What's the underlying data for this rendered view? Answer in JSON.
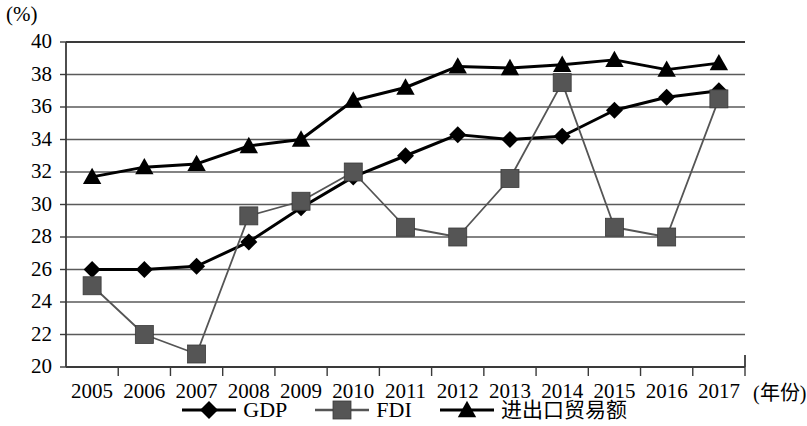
{
  "chart_data": {
    "type": "line",
    "title": "",
    "subtitle": "",
    "xlabel": "(年份)",
    "ylabel": "(%)",
    "unit_label": "(%)",
    "categories": [
      "2005",
      "2006",
      "2007",
      "2008",
      "2009",
      "2010",
      "2011",
      "2012",
      "2013",
      "2014",
      "2015",
      "2016",
      "2017"
    ],
    "x_tick_labels": [
      "2005",
      "2006",
      "2007",
      "2008",
      "2009",
      "2010",
      "2011",
      "2012",
      "2013",
      "2014",
      "2015",
      "2016",
      "2017"
    ],
    "y_tick_labels": [
      "40",
      "38",
      "36",
      "34",
      "32",
      "30",
      "28",
      "26",
      "24",
      "22",
      "20"
    ],
    "y_ticks": [
      20,
      22,
      24,
      26,
      28,
      30,
      32,
      34,
      36,
      38,
      40
    ],
    "ylim": [
      20,
      40
    ],
    "grid": "horizontal",
    "legend_position": "bottom-center",
    "series": [
      {
        "name": "GDP",
        "marker": "diamond",
        "color": "#000000",
        "values": [
          26.0,
          26.0,
          26.2,
          27.7,
          29.8,
          31.7,
          33.0,
          34.3,
          34.0,
          34.2,
          35.8,
          36.6,
          37.0
        ]
      },
      {
        "name": "FDI",
        "marker": "square",
        "color": "#555555",
        "values": [
          25.0,
          22.0,
          20.8,
          29.3,
          30.2,
          32.0,
          28.6,
          28.0,
          31.6,
          37.5,
          28.6,
          28.0,
          36.5
        ]
      },
      {
        "name": "进出口贸易额",
        "marker": "triangle",
        "color": "#000000",
        "values": [
          31.7,
          32.3,
          32.5,
          33.6,
          34.0,
          36.4,
          37.2,
          38.5,
          38.4,
          38.6,
          38.9,
          38.3,
          38.7
        ]
      }
    ]
  },
  "legend": {
    "items": [
      {
        "label": "GDP",
        "marker": "diamond"
      },
      {
        "label": "FDI",
        "marker": "square"
      },
      {
        "label": "进出口贸易额",
        "marker": "triangle"
      }
    ]
  },
  "axes": {
    "x_axis_unit": "(年份)",
    "y_axis_unit": "(%)"
  }
}
